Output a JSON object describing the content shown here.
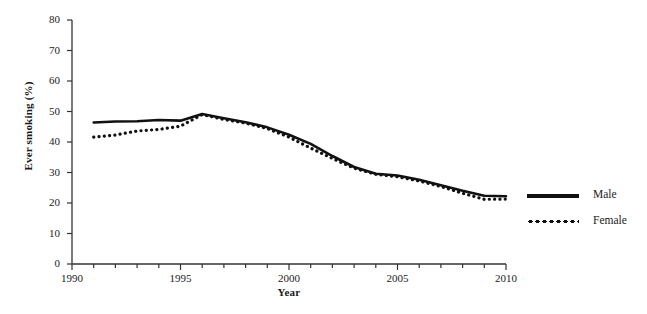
{
  "chart_data": {
    "type": "line",
    "title": "",
    "xlabel": "Year",
    "ylabel": "Ever smoking (%)",
    "xlim": [
      1990,
      2010
    ],
    "ylim": [
      0,
      80
    ],
    "grid": false,
    "legend_position": "right",
    "x_tick_labels": [
      "1990",
      "1995",
      "2000",
      "2005",
      "2010"
    ],
    "x_tick_values": [
      1990,
      1995,
      2000,
      2005,
      2010
    ],
    "x_minor_tick_step": 1,
    "y_tick_labels": [
      "0",
      "10",
      "20",
      "30",
      "40",
      "50",
      "60",
      "70",
      "80"
    ],
    "y_tick_values": [
      0,
      10,
      20,
      30,
      40,
      50,
      60,
      70,
      80
    ],
    "x": [
      1991,
      1992,
      1993,
      1994,
      1995,
      1996,
      1997,
      1998,
      1999,
      2000,
      2001,
      2002,
      2003,
      2004,
      2005,
      2006,
      2007,
      2008,
      2009,
      2010
    ],
    "series": [
      {
        "name": "Male",
        "style": "solid",
        "color": "#111111",
        "values": [
          46.4,
          46.7,
          46.8,
          47.2,
          47.0,
          49.2,
          47.8,
          46.5,
          44.8,
          42.4,
          39.4,
          35.4,
          31.8,
          29.6,
          29.0,
          27.6,
          25.8,
          24.0,
          22.4,
          22.2
        ]
      },
      {
        "name": "Female",
        "style": "dotted",
        "color": "#111111",
        "values": [
          41.6,
          42.3,
          43.6,
          44.1,
          45.2,
          49.0,
          47.4,
          46.2,
          44.4,
          41.6,
          38.0,
          34.6,
          31.4,
          29.4,
          28.6,
          27.2,
          25.4,
          23.2,
          21.2,
          21.3
        ]
      }
    ]
  },
  "legend": {
    "items": [
      {
        "label": "Male"
      },
      {
        "label": "Female"
      }
    ]
  }
}
